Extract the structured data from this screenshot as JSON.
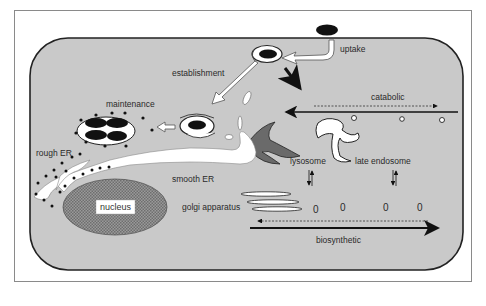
{
  "diagram": {
    "type": "cell-biology-schematic",
    "colors": {
      "background": "#ffffff",
      "frame_border": "#8a8a8a",
      "cytoplasm": "#c9c9c9",
      "cell_border": "#222222",
      "organelle_fill": "#ffffff",
      "dark": "#111111",
      "golgi_dark": "#6a6a6a",
      "nucleus": "#8c8c8c"
    },
    "labels": {
      "uptake": "uptake",
      "establishment": "establishment",
      "maintenance": "maintenance",
      "catabolic": "catabolic",
      "rough_er": "rough ER",
      "smooth_er": "smooth ER",
      "lysosome": "lysosome",
      "late_endosome": "late endosome",
      "nucleus": "nucleus",
      "golgi_apparatus": "golgi apparatus",
      "biosynthetic": "biosynthetic"
    },
    "vesicle_markers": [
      "0",
      "0",
      "0",
      "0"
    ],
    "pathways": [
      {
        "name": "uptake",
        "from": "extracellular particle",
        "to": "phagosome"
      },
      {
        "name": "establishment",
        "from": "phagosome",
        "to": "vacuole"
      },
      {
        "name": "maintenance",
        "from": "vacuole",
        "to": "replicative vacuole"
      },
      {
        "name": "catabolic",
        "direction": "right-to-left",
        "via": [
          "late endosome",
          "lysosome"
        ]
      },
      {
        "name": "biosynthetic",
        "direction": "left-to-right",
        "from": "golgi apparatus"
      }
    ]
  }
}
